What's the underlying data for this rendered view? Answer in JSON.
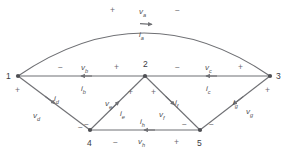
{
  "diagram": {
    "stroke_color": "#6f7074",
    "text_color": "#55565a",
    "background": "#ffffff",
    "nodes": [
      {
        "id": "1",
        "label": "1",
        "x": 18,
        "y": 76
      },
      {
        "id": "2",
        "label": "2",
        "x": 145,
        "y": 76
      },
      {
        "id": "3",
        "label": "3",
        "x": 270,
        "y": 76
      },
      {
        "id": "4",
        "label": "4",
        "x": 90,
        "y": 130
      },
      {
        "id": "5",
        "label": "5",
        "x": 200,
        "y": 130
      }
    ],
    "branches": [
      {
        "id": "a",
        "from": "1",
        "to": "3",
        "voltage": "v",
        "voltage_sub": "a",
        "current": "i",
        "current_sub": "a",
        "shape": "arc"
      },
      {
        "id": "b",
        "from": "1",
        "to": "2",
        "voltage": "v",
        "voltage_sub": "b",
        "current": "i",
        "current_sub": "b",
        "shape": "line"
      },
      {
        "id": "c",
        "from": "2",
        "to": "3",
        "voltage": "v",
        "voltage_sub": "c",
        "current": "i",
        "current_sub": "c",
        "shape": "line"
      },
      {
        "id": "d",
        "from": "1",
        "to": "4",
        "voltage": "v",
        "voltage_sub": "d",
        "current": "i",
        "current_sub": "d",
        "shape": "line"
      },
      {
        "id": "e",
        "from": "4",
        "to": "2",
        "voltage": "v",
        "voltage_sub": "e",
        "current": "i",
        "current_sub": "e",
        "shape": "line"
      },
      {
        "id": "f",
        "from": "2",
        "to": "5",
        "voltage": "v",
        "voltage_sub": "f",
        "current": "i",
        "current_sub": "f",
        "shape": "line"
      },
      {
        "id": "g",
        "from": "3",
        "to": "5",
        "voltage": "v",
        "voltage_sub": "g",
        "current": "i",
        "current_sub": "g",
        "shape": "line"
      },
      {
        "id": "h",
        "from": "4",
        "to": "5",
        "voltage": "v",
        "voltage_sub": "h",
        "current": "i",
        "current_sub": "h",
        "shape": "line"
      }
    ],
    "signs": {
      "a_plus": "+",
      "a_minus": "−",
      "b_minus": "−",
      "b_plus": "+",
      "c_minus": "−",
      "c_plus": "+",
      "d_plus": "+",
      "d_minus": "−",
      "e_minus": "−",
      "e_plus": "+",
      "f_plus": "+",
      "f_minus": "−",
      "g_plus": "+",
      "g_minus": "−",
      "h_minus": "−",
      "h_plus": "+"
    },
    "labels": {
      "v_a": "v",
      "v_a_sub": "a",
      "i_a": "i",
      "i_a_sub": "a",
      "v_b": "v",
      "v_b_sub": "b",
      "i_b": "i",
      "i_b_sub": "b",
      "v_c": "v",
      "v_c_sub": "c",
      "i_c": "i",
      "i_c_sub": "c",
      "v_d": "v",
      "v_d_sub": "d",
      "i_d": "i",
      "i_d_sub": "d",
      "v_e": "v",
      "v_e_sub": "e",
      "i_e": "i",
      "i_e_sub": "e",
      "v_f": "v",
      "v_f_sub": "f",
      "i_f": "i",
      "i_f_sub": "f",
      "v_g": "v",
      "v_g_sub": "g",
      "i_g": "i",
      "i_g_sub": "g",
      "v_h": "v",
      "v_h_sub": "h",
      "i_h": "i",
      "i_h_sub": "h"
    }
  }
}
